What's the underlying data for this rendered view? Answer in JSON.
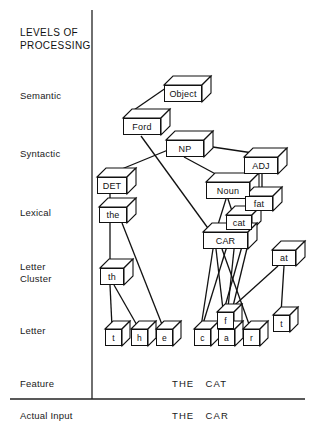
{
  "figure": {
    "heading": "LEVELS OF\nPROCESSING",
    "levels": [
      {
        "name": "semantic",
        "label": "Semantic",
        "x": 20,
        "y": 90
      },
      {
        "name": "syntactic",
        "label": "Syntactic",
        "x": 20,
        "y": 148
      },
      {
        "name": "lexical",
        "label": "Lexical",
        "x": 20,
        "y": 207
      },
      {
        "name": "letter-cluster",
        "label": "Letter\nCluster",
        "x": 20,
        "y": 261
      },
      {
        "name": "letter",
        "label": "Letter",
        "x": 20,
        "y": 325
      },
      {
        "name": "feature",
        "label": "Feature",
        "x": 20,
        "y": 378
      },
      {
        "name": "actual-input",
        "label": "Actual Input",
        "x": 20,
        "y": 410
      }
    ],
    "rows": [
      {
        "name": "feature-row",
        "text": "THE   CAT",
        "x": 172,
        "y": 378
      },
      {
        "name": "actual-input-row",
        "text": "THE   CAR",
        "x": 172,
        "y": 410
      }
    ],
    "nodes": [
      {
        "id": "object",
        "label": "Object",
        "level": "semantic",
        "x": 164,
        "y": 85,
        "w": 38,
        "h": 17,
        "d": 9
      },
      {
        "id": "ford",
        "label": "Ford",
        "level": "semantic",
        "x": 123,
        "y": 118,
        "w": 38,
        "h": 17,
        "d": 9
      },
      {
        "id": "np",
        "label": "NP",
        "level": "syntactic",
        "x": 166,
        "y": 140,
        "w": 38,
        "h": 17,
        "d": 9
      },
      {
        "id": "adj",
        "label": "ADJ",
        "level": "syntactic",
        "x": 244,
        "y": 157,
        "w": 34,
        "h": 17,
        "d": 9
      },
      {
        "id": "det",
        "label": "DET",
        "level": "syntactic",
        "x": 97,
        "y": 177,
        "w": 30,
        "h": 17,
        "d": 9
      },
      {
        "id": "noun",
        "label": "Noun",
        "level": "lexical",
        "x": 206,
        "y": 182,
        "w": 44,
        "h": 17,
        "d": 9
      },
      {
        "id": "fat",
        "label": "fat",
        "level": "lexical",
        "x": 245,
        "y": 196,
        "w": 28,
        "h": 15,
        "d": 9
      },
      {
        "id": "the",
        "label": "the",
        "level": "lexical",
        "x": 99,
        "y": 207,
        "w": 28,
        "h": 16,
        "d": 9
      },
      {
        "id": "cat",
        "label": "cat",
        "level": "lexical",
        "x": 226,
        "y": 215,
        "w": 26,
        "h": 15,
        "d": 9
      },
      {
        "id": "car",
        "label": "CAR",
        "level": "lexical",
        "x": 203,
        "y": 232,
        "w": 45,
        "h": 17,
        "d": 9
      },
      {
        "id": "th",
        "label": "th",
        "level": "letter-cluster",
        "x": 100,
        "y": 268,
        "w": 24,
        "h": 17,
        "d": 9
      },
      {
        "id": "at",
        "label": "at",
        "level": "letter-cluster",
        "x": 272,
        "y": 250,
        "w": 24,
        "h": 16,
        "d": 9
      },
      {
        "id": "let-t1",
        "label": "t",
        "level": "letter",
        "x": 105,
        "y": 329,
        "w": 17,
        "h": 17,
        "d": 8
      },
      {
        "id": "let-h",
        "label": "h",
        "level": "letter",
        "x": 131,
        "y": 329,
        "w": 17,
        "h": 17,
        "d": 8
      },
      {
        "id": "let-e",
        "label": "e",
        "level": "letter",
        "x": 156,
        "y": 329,
        "w": 17,
        "h": 17,
        "d": 8
      },
      {
        "id": "let-c",
        "label": "c",
        "level": "letter",
        "x": 194,
        "y": 329,
        "w": 17,
        "h": 17,
        "d": 8
      },
      {
        "id": "let-f",
        "label": "f",
        "level": "letter",
        "x": 217,
        "y": 312,
        "w": 17,
        "h": 17,
        "d": 8
      },
      {
        "id": "let-a",
        "label": "a",
        "level": "letter",
        "x": 218,
        "y": 329,
        "w": 17,
        "h": 17,
        "d": 8
      },
      {
        "id": "let-r",
        "label": "r",
        "level": "letter",
        "x": 243,
        "y": 329,
        "w": 17,
        "h": 17,
        "d": 8
      },
      {
        "id": "let-t2",
        "label": "t",
        "level": "letter",
        "x": 273,
        "y": 315,
        "w": 17,
        "h": 17,
        "d": 8
      }
    ],
    "links": [
      {
        "from": "object",
        "to": "ford",
        "x1": 176,
        "y1": 81,
        "x2": 131,
        "y2": 112
      },
      {
        "from": "ford",
        "to": "car",
        "x1": 141,
        "y1": 136,
        "x2": 210,
        "y2": 231
      },
      {
        "from": "np",
        "to": "det",
        "x1": 168,
        "y1": 150,
        "x2": 112,
        "y2": 173
      },
      {
        "from": "np",
        "to": "adj",
        "x1": 206,
        "y1": 146,
        "x2": 253,
        "y2": 153
      },
      {
        "from": "np",
        "to": "noun",
        "x1": 184,
        "y1": 157,
        "x2": 223,
        "y2": 178
      },
      {
        "from": "adj",
        "to": "fat",
        "x1": 256,
        "y1": 174,
        "x2": 256,
        "y2": 196
      },
      {
        "from": "adj",
        "to": "fat2",
        "x1": 262,
        "y1": 174,
        "x2": 262,
        "y2": 196
      },
      {
        "from": "det",
        "to": "the",
        "x1": 110,
        "y1": 192,
        "x2": 110,
        "y2": 206
      },
      {
        "from": "noun",
        "to": "cat",
        "x1": 228,
        "y1": 199,
        "x2": 233,
        "y2": 214
      },
      {
        "from": "noun",
        "to": "car",
        "x1": 226,
        "y1": 199,
        "x2": 216,
        "y2": 231
      },
      {
        "from": "the",
        "to": "th",
        "x1": 110,
        "y1": 223,
        "x2": 110,
        "y2": 267
      },
      {
        "from": "the",
        "to": "let-e",
        "x1": 122,
        "y1": 223,
        "x2": 163,
        "y2": 327
      },
      {
        "from": "th",
        "to": "let-t1",
        "x1": 110,
        "y1": 285,
        "x2": 112,
        "y2": 327
      },
      {
        "from": "th",
        "to": "let-h",
        "x1": 114,
        "y1": 285,
        "x2": 138,
        "y2": 327
      },
      {
        "from": "car",
        "to": "let-c",
        "x1": 213,
        "y1": 249,
        "x2": 201,
        "y2": 327
      },
      {
        "from": "car",
        "to": "let-a",
        "x1": 216,
        "y1": 249,
        "x2": 225,
        "y2": 327
      },
      {
        "from": "car",
        "to": "let-r",
        "x1": 222,
        "y1": 249,
        "x2": 250,
        "y2": 327
      },
      {
        "from": "cat",
        "to": "let-c",
        "x1": 232,
        "y1": 230,
        "x2": 202,
        "y2": 327
      },
      {
        "from": "cat",
        "to": "let-a",
        "x1": 236,
        "y1": 230,
        "x2": 226,
        "y2": 327
      },
      {
        "from": "fat",
        "to": "let-f",
        "x1": 252,
        "y1": 211,
        "x2": 224,
        "y2": 310
      },
      {
        "from": "fat",
        "to": "let-a",
        "x1": 256,
        "y1": 211,
        "x2": 228,
        "y2": 327
      },
      {
        "from": "at",
        "to": "let-a",
        "x1": 278,
        "y1": 266,
        "x2": 227,
        "y2": 312
      },
      {
        "from": "at",
        "to": "let-t2",
        "x1": 284,
        "y1": 266,
        "x2": 281,
        "y2": 313
      }
    ],
    "rules": [
      {
        "name": "vertical-divider",
        "x1": 92,
        "y1": 10,
        "x2": 92,
        "y2": 399,
        "w": 1.3
      },
      {
        "name": "horizontal-rule",
        "x1": 10,
        "y1": 399,
        "x2": 305,
        "y2": 399,
        "w": 1.4
      }
    ]
  }
}
